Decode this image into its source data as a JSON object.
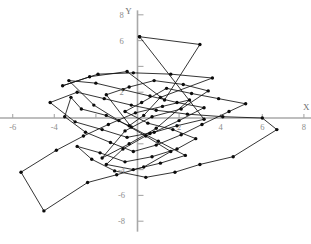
{
  "figure": {
    "axis_titles": {
      "x": "X",
      "y": "Y"
    },
    "axis_color": "#a8a8a8",
    "data_color": "#111111",
    "tick_label_color": "#8d8d8d"
  },
  "chart_data": {
    "type": "scatter",
    "title": "",
    "subtitle": "",
    "xlabel": "X",
    "ylabel": "Y",
    "xlim": [
      -7,
      8.5
    ],
    "ylim": [
      -8.5,
      8.5
    ],
    "grid": false,
    "legend": null,
    "connected": true,
    "marker": "filled-circle",
    "xticks": [
      -6,
      -4,
      -2,
      2,
      4,
      6,
      8
    ],
    "xtick_labels": [
      "-6",
      "-4",
      "-2",
      "2",
      "4",
      "6",
      "8"
    ],
    "yticks": [
      8,
      6,
      4,
      2,
      -2,
      -4,
      -6,
      -8
    ],
    "ytick_labels": [
      "8",
      "6",
      "4",
      "2",
      "-2",
      "-4",
      "-6",
      "-8"
    ],
    "visible_xtick_labels": [
      "-6",
      "-4",
      "2",
      "4",
      "6",
      "8"
    ],
    "visible_ytick_labels": [
      "8",
      "6",
      "2",
      "-4",
      "-6",
      "-8"
    ],
    "series": [
      {
        "name": "path",
        "points": [
          [
            0.1,
            6.3
          ],
          [
            3.0,
            5.7
          ],
          [
            1.3,
            1.4
          ],
          [
            -0.5,
            3.6
          ],
          [
            -2.3,
            3.2
          ],
          [
            -3.6,
            2.5
          ],
          [
            -1.9,
            3.4
          ],
          [
            -0.2,
            3.5
          ],
          [
            1.6,
            3.4
          ],
          [
            3.6,
            3.1
          ],
          [
            1.1,
            1.6
          ],
          [
            0.3,
            0.2
          ],
          [
            -0.4,
            -0.6
          ],
          [
            -1.5,
            0.2
          ],
          [
            -2.7,
            0.7
          ],
          [
            -3.2,
            1.6
          ],
          [
            -3.5,
            0.1
          ],
          [
            -2.5,
            -1.1
          ],
          [
            -1.3,
            -1.9
          ],
          [
            -0.2,
            -2.6
          ],
          [
            0.9,
            -2.1
          ],
          [
            2.1,
            -1.3
          ],
          [
            3.1,
            -0.5
          ],
          [
            4.4,
            0.5
          ],
          [
            5.2,
            1.1
          ],
          [
            3.9,
            1.5
          ],
          [
            2.6,
            1.9
          ],
          [
            1.4,
            2.3
          ],
          [
            0.2,
            1.2
          ],
          [
            -0.6,
            0.5
          ],
          [
            0.5,
            -0.4
          ],
          [
            1.7,
            -0.9
          ],
          [
            2.8,
            -1.6
          ],
          [
            1.9,
            -2.4
          ],
          [
            0.7,
            -3.0
          ],
          [
            -0.6,
            -3.4
          ],
          [
            -1.8,
            -2.7
          ],
          [
            -2.9,
            -2.2
          ],
          [
            -2.2,
            -3.2
          ],
          [
            -1.1,
            -4.1
          ],
          [
            0.4,
            -4.6
          ],
          [
            1.8,
            -4.2
          ],
          [
            3.0,
            -3.6
          ],
          [
            4.6,
            -3.0
          ],
          [
            6.7,
            -0.9
          ],
          [
            6.0,
            0.0
          ],
          [
            4.1,
            0.1
          ],
          [
            2.4,
            0.3
          ],
          [
            0.9,
            0.6
          ],
          [
            -0.3,
            1.0
          ],
          [
            -1.6,
            1.5
          ],
          [
            -2.9,
            2.0
          ],
          [
            -4.2,
            1.2
          ],
          [
            -3.0,
            -0.3
          ],
          [
            -1.7,
            -0.9
          ],
          [
            -0.5,
            -1.5
          ],
          [
            0.8,
            -1.1
          ],
          [
            2.0,
            -0.2
          ],
          [
            3.2,
            0.8
          ],
          [
            1.9,
            1.2
          ],
          [
            0.6,
            1.7
          ],
          [
            -0.7,
            2.2
          ],
          [
            -2.0,
            2.7
          ],
          [
            -3.3,
            2.9
          ],
          [
            -2.1,
            1.0
          ],
          [
            -0.9,
            -0.2
          ],
          [
            0.4,
            -1.4
          ],
          [
            1.6,
            -2.6
          ],
          [
            0.3,
            -3.8
          ],
          [
            -1.0,
            -4.4
          ],
          [
            -2.4,
            -5.0
          ],
          [
            -4.5,
            -7.2
          ],
          [
            -5.6,
            -4.2
          ],
          [
            -3.9,
            -2.5
          ],
          [
            -2.6,
            -1.4
          ],
          [
            -1.4,
            -0.5
          ],
          [
            -0.1,
            0.4
          ],
          [
            1.2,
            0.9
          ],
          [
            2.5,
            1.4
          ],
          [
            0.9,
            -0.8
          ],
          [
            -0.4,
            -2.0
          ],
          [
            -1.7,
            -3.1
          ],
          [
            -0.6,
            -1.0
          ],
          [
            0.7,
            0.1
          ],
          [
            2.1,
            0.7
          ],
          [
            3.4,
            2.1
          ],
          [
            2.2,
            2.6
          ],
          [
            0.8,
            2.9
          ],
          [
            -0.4,
            2.4
          ],
          [
            -1.5,
            1.8
          ],
          [
            -0.3,
            -0.7
          ],
          [
            1.0,
            -1.8
          ],
          [
            2.3,
            -2.9
          ],
          [
            1.1,
            -3.5
          ],
          [
            -0.2,
            -4.0
          ],
          [
            -1.5,
            -3.6
          ],
          [
            -0.7,
            -2.4
          ],
          [
            0.6,
            -1.2
          ],
          [
            1.9,
            -0.6
          ],
          [
            3.2,
            -0.1
          ],
          [
            0.1,
            6.3
          ]
        ]
      }
    ]
  }
}
